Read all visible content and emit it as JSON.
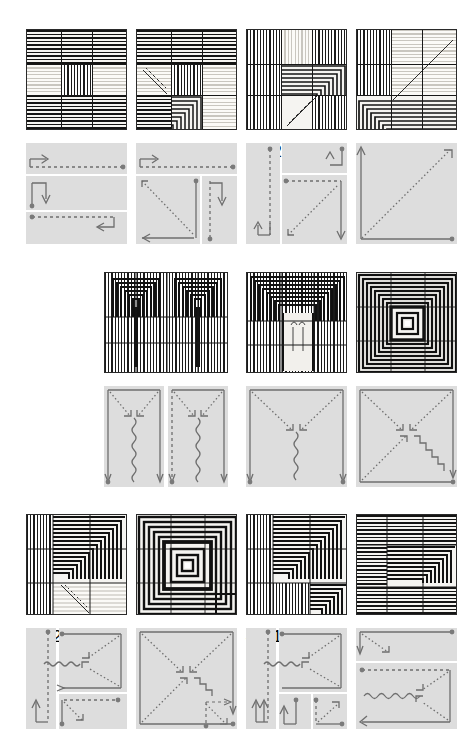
{
  "figure": {
    "kind": "weave-pattern-plate",
    "background": "#ffffff",
    "pattern_colors": {
      "dark": "#141414",
      "light": "#f5f4f1",
      "pale": "#c9c6bf"
    },
    "diagram_colors": {
      "panel": "#dddddd",
      "stroke": "#6e6e6e",
      "label": "#3b3b3b",
      "node": "#7a7a7a"
    },
    "rows": 3,
    "units_total": 11
  },
  "row1": {
    "units": [
      {
        "id": "u1",
        "pattern": {
          "grid": "3x3",
          "cells": [
            "h",
            "h",
            "h",
            "pale",
            "v",
            "pale",
            "h",
            "h",
            "h"
          ]
        },
        "diagram": {
          "regions": [
            {
              "label": "2",
              "kind": "band-top",
              "arrow": "right",
              "line": "dashed"
            },
            {
              "label": "1",
              "kind": "band-middle",
              "arrow": "down",
              "line": "solid"
            },
            {
              "label": "3",
              "kind": "band-bottom",
              "arrow": "left",
              "line": "dashed"
            }
          ],
          "labels": [
            "2",
            "1",
            "3"
          ]
        }
      },
      {
        "id": "u2",
        "pattern": {
          "grid": "3x3",
          "cells": [
            "h",
            "h",
            "h",
            "pale-diag",
            "v",
            "pale",
            "corner-concentric",
            "h",
            "pale"
          ]
        },
        "diagram": {
          "regions": [
            {
              "label": "3",
              "kind": "band-top",
              "arrow": "right",
              "line": "dashed"
            },
            {
              "label": "1",
              "kind": "square-left",
              "arrow": "diag-up-left",
              "line": "dotted"
            },
            {
              "label": "2",
              "kind": "strip-right",
              "arrow": "down",
              "line": "dashed"
            }
          ],
          "labels": [
            "3",
            "1",
            "2"
          ]
        }
      },
      {
        "id": "u3",
        "pattern": {
          "grid": "3x3",
          "cells": [
            "v",
            "pale",
            "v",
            "v",
            "corner-concentric",
            "pale",
            "v",
            "diag-concentric",
            "v"
          ]
        },
        "diagram": {
          "regions": [
            {
              "label": "3",
              "kind": "strip-left",
              "arrow": "up",
              "line": "dashed"
            },
            {
              "label": "1",
              "kind": "band-top",
              "arrow": "up",
              "line": "solid"
            },
            {
              "label": "2",
              "kind": "square-main",
              "arrow": "diag-down-left",
              "line": "dotted"
            }
          ],
          "labels": [
            "3",
            "1",
            "2"
          ]
        }
      },
      {
        "id": "u4",
        "pattern": {
          "grid": "3x3",
          "cells": [
            "v",
            "pale",
            "diag-pale",
            "v",
            "diag-pale",
            "pale",
            "corner-concentric",
            "h",
            "h"
          ]
        },
        "diagram": {
          "regions": [
            {
              "label": "1",
              "kind": "square-full",
              "arrow": "diag-up-right",
              "line": "dotted"
            }
          ],
          "labels": [
            "1"
          ]
        }
      }
    ]
  },
  "row2": {
    "units": [
      {
        "id": "u5",
        "pattern": {
          "grid": "3x3-double",
          "cells": [
            "top-concentric-pair",
            "v",
            "v"
          ]
        },
        "diagram": {
          "regions": [
            {
              "label": "1",
              "kind": "tall-left",
              "arrow": "v-converge",
              "line": "wavy"
            },
            {
              "label": "2",
              "kind": "tall-right",
              "arrow": "v-converge",
              "line": "wavy"
            }
          ],
          "labels": [
            "1",
            "2"
          ]
        }
      },
      {
        "id": "u6",
        "pattern": {
          "grid": "3x3",
          "cells": [
            "top-concentric",
            "pale",
            "v"
          ]
        },
        "diagram": {
          "regions": [
            {
              "label": "1",
              "kind": "tall",
              "arrow": "v-converge",
              "line": "wavy"
            }
          ],
          "labels": [
            "1"
          ]
        }
      },
      {
        "id": "u7",
        "pattern": {
          "grid": "3x3",
          "cells": [
            "centre-concentric"
          ]
        },
        "diagram": {
          "regions": [
            {
              "label": "1",
              "kind": "square-full",
              "arrow": "x-converge",
              "line": "stair"
            }
          ],
          "labels": [
            "1"
          ]
        }
      }
    ]
  },
  "row3": {
    "units": [
      {
        "id": "u8",
        "pattern": {
          "grid": "3x3",
          "cells": [
            "v",
            "h-concentric",
            "h-concentric",
            "v",
            "h-concentric",
            "h-concentric",
            "v",
            "diag-pale",
            "pale"
          ]
        },
        "diagram": {
          "regions": [
            {
              "label": "3",
              "kind": "strip-left",
              "arrow": "up",
              "line": "dashed"
            },
            {
              "label": "1",
              "kind": "square-upper",
              "arrow": "diag-in",
              "line": "wavy"
            },
            {
              "label": "2",
              "kind": "band-lower",
              "arrow": "right",
              "line": "dashed"
            }
          ],
          "labels": [
            "3",
            "1",
            "2"
          ]
        }
      },
      {
        "id": "u9",
        "pattern": {
          "grid": "3x3",
          "cells": [
            "centre-concentric-big"
          ]
        },
        "diagram": {
          "regions": [
            {
              "label": "1",
              "kind": "square-full",
              "arrow": "x-converge",
              "line": "stair"
            },
            {
              "label": "2",
              "kind": "inset-corner",
              "arrow": "diag",
              "line": "dashed"
            }
          ],
          "labels": [
            "1",
            "2"
          ]
        }
      },
      {
        "id": "u10",
        "pattern": {
          "grid": "3x3",
          "cells": [
            "v",
            "h-concentric",
            "h-concentric",
            "v",
            "h-concentric",
            "h-concentric",
            "v",
            "v",
            "h-concentric"
          ]
        },
        "diagram": {
          "regions": [
            {
              "label": "4",
              "kind": "strip-left",
              "arrow": "up",
              "line": "dashed"
            },
            {
              "label": "3",
              "kind": "square-upper",
              "arrow": "diag-in",
              "line": "wavy"
            },
            {
              "label": "1",
              "kind": "inset-left",
              "arrow": "up",
              "line": "solid"
            },
            {
              "label": "2",
              "kind": "inset-right",
              "arrow": "diag-up-right",
              "line": "dotted"
            }
          ],
          "labels": [
            "4",
            "3",
            "1",
            "2"
          ]
        }
      },
      {
        "id": "u11",
        "pattern": {
          "grid": "3x3",
          "cells": [
            "h",
            "h",
            "h",
            "h",
            "h-concentric",
            "h-concentric",
            "h",
            "h",
            "h"
          ]
        },
        "diagram": {
          "regions": [
            {
              "label": "1",
              "kind": "band-top",
              "arrow": "diag-down-right",
              "line": "dotted"
            },
            {
              "label": "2",
              "kind": "band-lower",
              "arrow": "diag-in",
              "line": "wavy"
            }
          ],
          "labels": [
            "1",
            "2"
          ]
        }
      }
    ]
  }
}
